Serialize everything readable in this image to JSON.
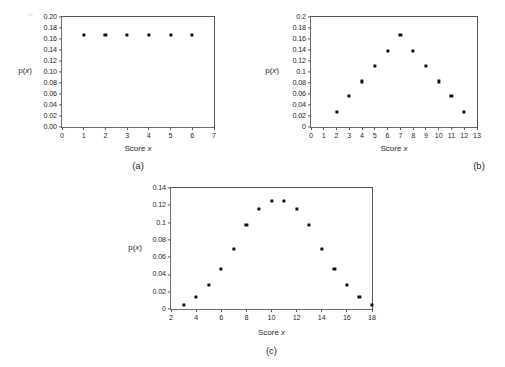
{
  "figure": {
    "background_color": "#ffffff",
    "frame_color": "#6b6b6b",
    "marker_color": "#111111"
  },
  "chart_data": [
    {
      "type": "scatter",
      "panel_label": "(a)",
      "title": "",
      "xlabel": "Score x",
      "ylabel": "p(x)",
      "x": [
        1,
        2,
        3,
        4,
        5,
        6
      ],
      "values": [
        0.167,
        0.167,
        0.167,
        0.167,
        0.167,
        0.167
      ],
      "xlim": [
        0,
        7
      ],
      "ylim": [
        0.0,
        0.2
      ],
      "xticks": [
        0,
        1,
        2,
        3,
        4,
        5,
        6,
        7
      ],
      "xticklabels": [
        "0",
        "1",
        "2",
        "3",
        "4",
        "5",
        "6",
        "7"
      ],
      "yticks": [
        0.0,
        0.02,
        0.04,
        0.06,
        0.08,
        0.1,
        0.12,
        0.14,
        0.16,
        0.18,
        0.2
      ],
      "yticklabels": [
        "0.00",
        "0.02",
        "0.04",
        "0.06",
        "0.08",
        "0.10",
        "0.12",
        "0.14",
        "0.16",
        "0.18",
        "0.20"
      ],
      "grid": false,
      "legend": false
    },
    {
      "type": "scatter",
      "panel_label": "(b)",
      "title": "",
      "xlabel": "Score x",
      "ylabel": "p(x)",
      "x": [
        2,
        3,
        4,
        5,
        6,
        7,
        8,
        9,
        10,
        11,
        12
      ],
      "values": [
        0.028,
        0.056,
        0.083,
        0.111,
        0.139,
        0.167,
        0.139,
        0.111,
        0.083,
        0.056,
        0.028
      ],
      "xlim": [
        0,
        13
      ],
      "ylim": [
        0.0,
        0.2
      ],
      "xticks": [
        0,
        1,
        2,
        3,
        4,
        5,
        6,
        7,
        8,
        9,
        10,
        11,
        12,
        13
      ],
      "xticklabels": [
        "0",
        "1",
        "2",
        "3",
        "4",
        "5",
        "6",
        "7",
        "8",
        "9",
        "10",
        "11",
        "12",
        "13"
      ],
      "yticks": [
        0.0,
        0.02,
        0.04,
        0.06,
        0.08,
        0.1,
        0.12,
        0.14,
        0.16,
        0.18,
        0.2
      ],
      "yticklabels": [
        "0",
        "0.02",
        "0.04",
        "0.06",
        "0.08",
        "0.1",
        "0.12",
        "0.14",
        "0.16",
        "0.18",
        "0.2"
      ],
      "grid": false,
      "legend": false
    },
    {
      "type": "scatter",
      "panel_label": "(c)",
      "title": "",
      "xlabel": "Score x",
      "ylabel": "p(x)",
      "x": [
        3,
        4,
        5,
        6,
        7,
        8,
        9,
        10,
        11,
        12,
        13,
        14,
        15,
        16,
        17,
        18
      ],
      "values": [
        0.005,
        0.014,
        0.028,
        0.046,
        0.07,
        0.097,
        0.116,
        0.125,
        0.125,
        0.116,
        0.097,
        0.07,
        0.046,
        0.028,
        0.014,
        0.005
      ],
      "xlim": [
        2,
        18
      ],
      "ylim": [
        0.0,
        0.14
      ],
      "xticks": [
        2,
        4,
        6,
        8,
        10,
        12,
        14,
        16,
        18
      ],
      "xticklabels": [
        "2",
        "4",
        "6",
        "8",
        "10",
        "12",
        "14",
        "16",
        "18"
      ],
      "yticks": [
        0.0,
        0.02,
        0.04,
        0.06,
        0.08,
        0.1,
        0.12,
        0.14
      ],
      "yticklabels": [
        "0",
        "0.02",
        "0.04",
        "0.06",
        "0.08",
        "0.1",
        "0.12",
        "0.14"
      ],
      "grid": false,
      "legend": false
    }
  ]
}
